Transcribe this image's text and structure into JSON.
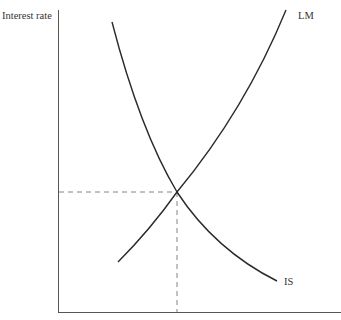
{
  "diagram": {
    "y_axis_label": "Interest rate",
    "curves": [
      {
        "name": "IS",
        "label": "IS",
        "slope": "downward"
      },
      {
        "name": "LM",
        "label": "LM",
        "slope": "upward"
      }
    ],
    "equilibrium": {
      "marked_with": "dashed lines to both axes"
    }
  },
  "colors": {
    "line": "#2a2a2a",
    "axis": "#555555",
    "dash": "#777777",
    "text": "#333333"
  }
}
